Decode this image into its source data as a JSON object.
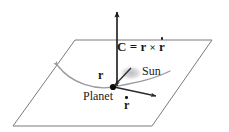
{
  "figure": {
    "width": 229,
    "height": 132,
    "background_color": "#ffffff"
  },
  "labels": {
    "formula": {
      "c": "C",
      "equals": "=",
      "r": "r",
      "cross": "×",
      "rdot": "r",
      "full_text": "C = r × ṙ"
    },
    "sun": "Sun",
    "planet": "Planet",
    "position_vector": "r",
    "velocity_vector": "r"
  },
  "colors": {
    "plane_stroke": "#7a7a80",
    "vector_stroke": "#1a1a1a",
    "orbit_stroke": "#9a9aa0",
    "sun_fill": "#c8c8cc",
    "text": "#1a1a1a"
  },
  "geometry": {
    "plane_corners": [
      [
        75,
        40
      ],
      [
        212,
        40
      ],
      [
        152,
        126
      ],
      [
        13,
        126
      ]
    ],
    "planet_point": [
      113,
      87
    ],
    "sun_point": [
      131,
      73
    ],
    "c_vector_tip": [
      117,
      10
    ],
    "c_vector_base": [
      117,
      86
    ],
    "rdot_vector_tip": [
      158,
      96
    ]
  }
}
